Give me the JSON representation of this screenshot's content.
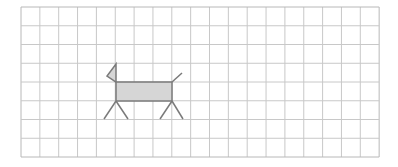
{
  "grid": {
    "x0": 21,
    "y0": 7,
    "cols": 19,
    "rows": 8,
    "cell_w": 18.85,
    "cell_h": 18.75,
    "line_color": "#c8c8c8",
    "border_color": "#b8b8b8"
  },
  "figure": {
    "name": "dog",
    "stroke_color": "#7a7a7a",
    "fill_color": "#d6d6d6",
    "body": {
      "x": 116,
      "y": 82,
      "w": 56,
      "h": 19
    },
    "head_flag": {
      "points": "116,64 107,76 116,82"
    },
    "tail": {
      "x1": 172,
      "y1": 82,
      "x2": 182,
      "y2": 73
    },
    "legs": [
      {
        "x1": 116,
        "y1": 101,
        "x2": 104,
        "y2": 119
      },
      {
        "x1": 116,
        "y1": 101,
        "x2": 128,
        "y2": 119
      },
      {
        "x1": 172,
        "y1": 101,
        "x2": 160,
        "y2": 119
      },
      {
        "x1": 172,
        "y1": 101,
        "x2": 183,
        "y2": 119
      }
    ]
  }
}
